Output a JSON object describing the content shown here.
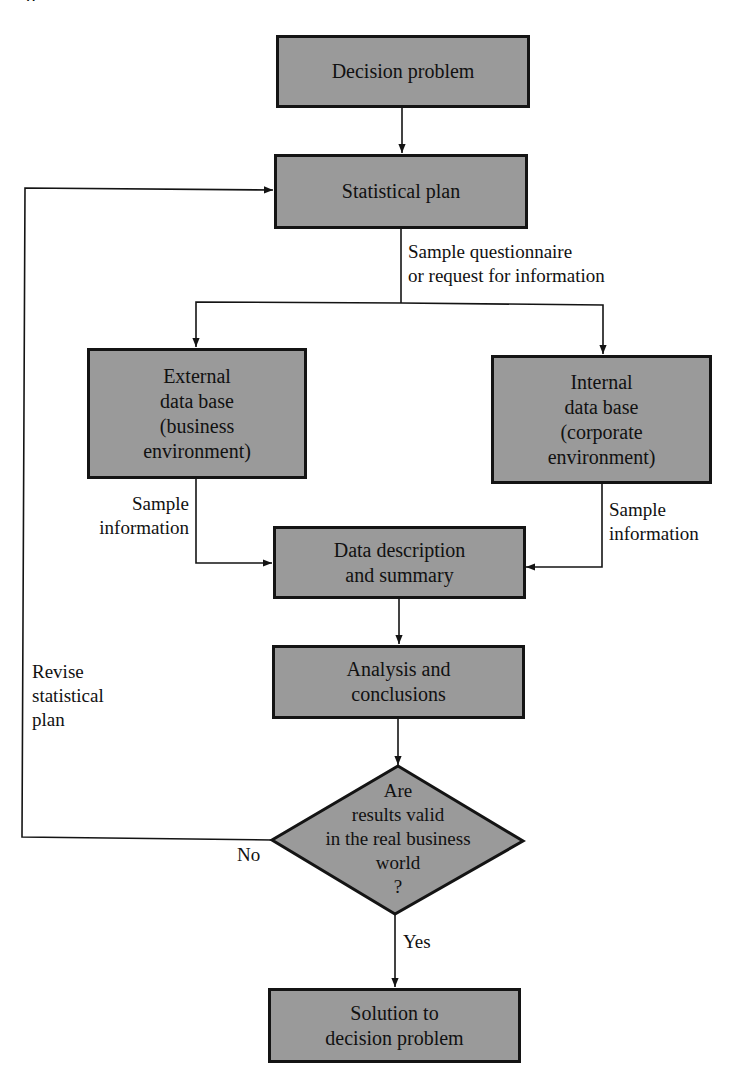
{
  "page": {
    "caption_fragment": "g"
  },
  "flowchart": {
    "nodes": {
      "decision_problem": {
        "lines": [
          "Decision problem"
        ]
      },
      "statistical_plan": {
        "lines": [
          "Statistical plan"
        ]
      },
      "external_db": {
        "lines": [
          "External",
          "data base",
          "(business",
          "environment)"
        ]
      },
      "internal_db": {
        "lines": [
          "Internal",
          "data base",
          "(corporate",
          "environment)"
        ]
      },
      "data_description": {
        "lines": [
          "Data description",
          "and summary"
        ]
      },
      "analysis": {
        "lines": [
          "Analysis and",
          "conclusions"
        ]
      },
      "validity_check": {
        "lines": [
          "Are",
          "results valid",
          "in the real business",
          "world",
          "?"
        ]
      },
      "solution": {
        "lines": [
          "Solution to",
          "decision problem"
        ]
      }
    },
    "edge_labels": {
      "questionnaire": [
        "Sample questionnaire",
        "or request for information"
      ],
      "sample_info_left": [
        "Sample",
        "information"
      ],
      "sample_info_right": [
        "Sample",
        "information"
      ],
      "revise": [
        "Revise",
        "statistical",
        "plan"
      ],
      "no": "No",
      "yes": "Yes"
    },
    "colors": {
      "node_fill": "#9a9a9a",
      "stroke": "#141414",
      "background": "#ffffff"
    }
  }
}
